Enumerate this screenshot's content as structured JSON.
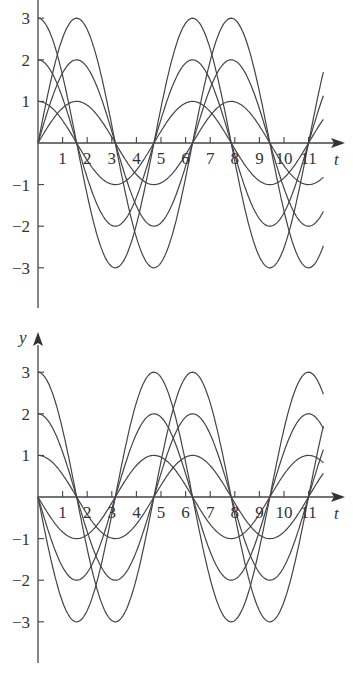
{
  "chart_data": [
    {
      "type": "line",
      "title": "",
      "xlabel": "t",
      "ylabel": "",
      "xlim": [
        0,
        11.6
      ],
      "ylim": [
        -3.6,
        3.4
      ],
      "x_ticks": [
        "1",
        "2",
        "3",
        "4",
        "5",
        "6",
        "7",
        "8",
        "9",
        "10",
        "11"
      ],
      "y_ticks": [
        "3",
        "2",
        "1",
        "-1",
        "-2",
        "-3"
      ],
      "grid": false,
      "legend": "none",
      "series": [
        {
          "name": "y = 1·cos t",
          "amplitude": 1,
          "func": "cos"
        },
        {
          "name": "y = 2·cos t",
          "amplitude": 2,
          "func": "cos"
        },
        {
          "name": "y = 3·cos t",
          "amplitude": 3,
          "func": "cos"
        },
        {
          "name": "y = 1·sin t",
          "amplitude": 1,
          "func": "sin"
        },
        {
          "name": "y = 2·sin t",
          "amplitude": 2,
          "func": "sin"
        },
        {
          "name": "y = 3·sin t",
          "amplitude": 3,
          "func": "sin"
        }
      ]
    },
    {
      "type": "line",
      "title": "",
      "xlabel": "t",
      "ylabel": "y",
      "xlim": [
        0,
        11.6
      ],
      "ylim": [
        -4,
        3.4
      ],
      "x_ticks": [
        "1",
        "2",
        "3",
        "4",
        "5",
        "6",
        "7",
        "8",
        "9",
        "10",
        "11"
      ],
      "y_ticks": [
        "3",
        "2",
        "1",
        "-1",
        "-2",
        "-3"
      ],
      "grid": false,
      "legend": "none",
      "series": [
        {
          "name": "y = 1·cos t",
          "amplitude": 1,
          "func": "cos"
        },
        {
          "name": "y = 2·cos t",
          "amplitude": 2,
          "func": "cos"
        },
        {
          "name": "y = 3·cos t",
          "amplitude": 3,
          "func": "cos"
        },
        {
          "name": "y = -1·sin t",
          "amplitude": 1,
          "func": "-sin"
        },
        {
          "name": "y = -2·sin t",
          "amplitude": 2,
          "func": "-sin"
        },
        {
          "name": "y = -3·sin t",
          "amplitude": 3,
          "func": "-sin"
        }
      ]
    }
  ],
  "labels": {
    "top": {
      "t_axis": "t",
      "y_ticks": [
        "3",
        "2",
        "1",
        "−1",
        "−2",
        "−3"
      ],
      "x_ticks": [
        "1",
        "2",
        "3",
        "4",
        "5",
        "6",
        "7",
        "8",
        "9",
        "10",
        "11"
      ]
    },
    "bottom": {
      "t_axis": "t",
      "y_axis": "y",
      "y_ticks": [
        "3",
        "2",
        "1",
        "−1",
        "−2",
        "−3"
      ],
      "x_ticks": [
        "1",
        "2",
        "3",
        "4",
        "5",
        "6",
        "7",
        "8",
        "9",
        "10",
        "11"
      ]
    }
  }
}
